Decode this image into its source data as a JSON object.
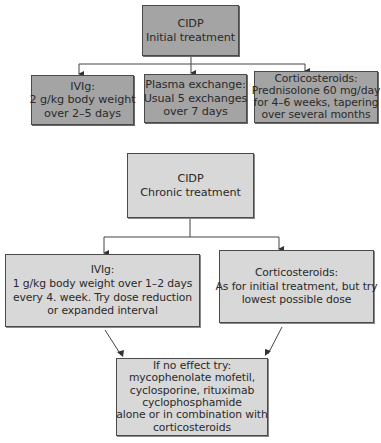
{
  "initial": {
    "title": {
      "lines": [
        "CIDP",
        "Initial treatment"
      ]
    },
    "options": [
      {
        "lines": [
          "IVIg:",
          "2 g/kg body weight",
          "over 2–5 days"
        ]
      },
      {
        "lines": [
          "Plasma exchange:",
          "Usual 5 exchanges",
          "over 7 days"
        ]
      },
      {
        "lines": [
          "Corticosteroids:",
          "Prednisolone 60 mg/day",
          "for 4–6 weeks, tapering",
          "over several months"
        ]
      }
    ]
  },
  "chronic": {
    "title": {
      "lines": [
        "CIDP",
        "Chronic treatment"
      ]
    },
    "options": [
      {
        "lines": [
          "IVIg:",
          "1 g/kg body weight over 1–2 days",
          "every 4. week. Try dose reduction",
          "or expanded interval"
        ]
      },
      {
        "lines": [
          "Corticosteroids:",
          "As for initial treatment, but try",
          "lowest possible dose"
        ]
      }
    ],
    "fallback": {
      "lines": [
        "If no effect try:",
        "mycophenolate mofetil,",
        "cyclosporine, rituximab",
        "cyclophosphamide",
        "alone or in combination with",
        "corticosteroids"
      ]
    }
  },
  "colors": {
    "initial_fill": "#a4a4a4",
    "chronic_fill": "#d8d8d8",
    "stroke": "#4a4a4a"
  }
}
